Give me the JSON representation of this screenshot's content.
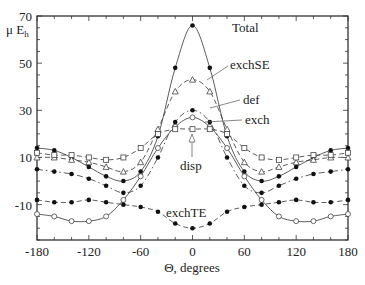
{
  "chart_data": {
    "type": "line",
    "title": "",
    "xlabel": "Θ, degrees",
    "ylabel": "μ E",
    "ylabel_sub": "h",
    "xlim": [
      -180,
      180
    ],
    "ylim": [
      -25,
      70
    ],
    "xticks": [
      -180,
      -120,
      -60,
      0,
      60,
      120,
      180
    ],
    "yticks": [
      70,
      50,
      30,
      10,
      -10
    ],
    "grid": false,
    "x": [
      -180,
      -160,
      -140,
      -120,
      -100,
      -80,
      -60,
      -40,
      -20,
      0,
      20,
      40,
      60,
      80,
      100,
      120,
      140,
      160,
      180
    ],
    "series": [
      {
        "name": "Total",
        "marker": "filled-circle",
        "dash": "solid",
        "values": [
          14,
          13,
          10,
          6,
          2,
          0,
          4,
          19,
          48,
          66,
          48,
          19,
          4,
          0,
          2,
          6,
          10,
          13,
          14
        ]
      },
      {
        "name": "exchSE",
        "marker": "open-triangle",
        "dash": "dashed",
        "values": [
          10,
          10,
          9,
          8,
          6,
          4,
          8,
          22,
          38,
          43,
          38,
          22,
          8,
          4,
          6,
          8,
          9,
          10,
          10
        ]
      },
      {
        "name": "def",
        "marker": "filled-circle",
        "dash": "dashdot",
        "values": [
          5,
          4,
          3,
          1,
          -2,
          -5,
          -2,
          10,
          25,
          30,
          25,
          10,
          -2,
          -5,
          -2,
          1,
          3,
          4,
          5
        ]
      },
      {
        "name": "exch",
        "marker": "open-circle",
        "dash": "solid",
        "values": [
          -14,
          -15,
          -17,
          -17,
          -15,
          -8,
          2,
          14,
          23,
          27,
          23,
          14,
          2,
          -8,
          -15,
          -17,
          -17,
          -15,
          -14
        ]
      },
      {
        "name": "disp",
        "marker": "open-square",
        "dash": "dashed",
        "values": [
          12,
          11,
          11,
          10,
          9,
          10,
          14,
          20,
          22,
          22,
          22,
          20,
          14,
          10,
          9,
          10,
          11,
          11,
          12
        ]
      },
      {
        "name": "exchTE",
        "marker": "filled-circle",
        "dash": "dashed",
        "values": [
          -8,
          -9,
          -9,
          -8,
          -9,
          -10,
          -11,
          -13,
          -18,
          -20,
          -18,
          -13,
          -11,
          -10,
          -9,
          -8,
          -9,
          -9,
          -8
        ]
      }
    ],
    "annotations": [
      {
        "text": "Total",
        "x": 232,
        "y": 32
      },
      {
        "text": "exchSE",
        "x": 230,
        "y": 69
      },
      {
        "text": "def",
        "x": 243,
        "y": 104
      },
      {
        "text": "exch",
        "x": 245,
        "y": 124
      },
      {
        "text": "disp",
        "x": 180,
        "y": 170
      },
      {
        "text": "exchTE",
        "x": 166,
        "y": 217
      }
    ]
  }
}
